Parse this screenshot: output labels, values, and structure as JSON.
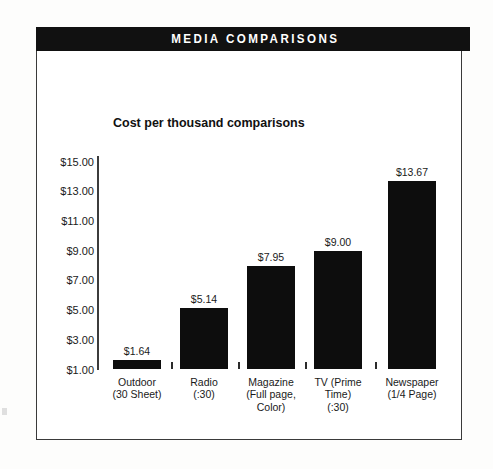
{
  "header": {
    "title": "MEDIA COMPARISONS"
  },
  "chart_data": {
    "type": "bar",
    "title": "MEDIA COMPARISONS",
    "subtitle": "Cost per thousand\ncomparisons",
    "xlabel": "",
    "ylabel": "",
    "ylim": [
      1.0,
      15.0
    ],
    "grid": false,
    "legend": null,
    "ytick_labels": [
      "$15.00",
      "$13.00",
      "$11.00",
      "$9.00",
      "$7.00",
      "$5.00",
      "$3.00",
      "$1.00"
    ],
    "ytick_values": [
      15.0,
      13.0,
      11.0,
      9.0,
      7.0,
      5.0,
      3.0,
      1.0
    ],
    "categories": [
      "Outdoor\n(30 Sheet)",
      "Radio\n(:30)",
      "Magazine\n(Full page,\nColor)",
      "TV (Prime\nTime)\n(:30)",
      "Newspaper\n(1/4 Page)"
    ],
    "values": [
      1.64,
      5.14,
      7.95,
      9.0,
      13.67
    ],
    "value_labels": [
      "$1.64",
      "$5.14",
      "$7.95",
      "$9.00",
      "$13.67"
    ],
    "bar_color": "#0d0d0d",
    "axis_color": "#3c3c3c",
    "background": "#ffffff"
  }
}
